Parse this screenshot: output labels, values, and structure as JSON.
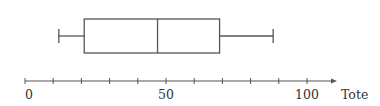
{
  "chart_data": {
    "type": "boxplot",
    "title": "",
    "orientation": "horizontal",
    "xlabel": "Tote",
    "ylabel": "",
    "xlim": [
      0,
      105
    ],
    "tick_interval": 10,
    "tick_labels": [
      "0",
      "50",
      "100"
    ],
    "labeled_ticks": [
      0,
      50,
      100
    ],
    "grid": false,
    "legend": null,
    "series": [
      {
        "name": "",
        "min": 12,
        "q1": 21,
        "median": 47,
        "q3": 69,
        "max": 88
      }
    ]
  },
  "colors": {
    "line": "#555555",
    "text": "#333333",
    "background": "#ffffff"
  }
}
